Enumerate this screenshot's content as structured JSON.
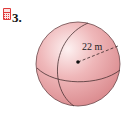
{
  "exercise": {
    "number": "3.",
    "icon": "calculator-icon",
    "icon_color": "#e03a3a"
  },
  "figure": {
    "shape": "sphere",
    "radius_label": "22 m",
    "fill_color": "#e9a3a6",
    "highlight_color": "#fbe6e7",
    "edge_color": "#5a3b3c"
  }
}
